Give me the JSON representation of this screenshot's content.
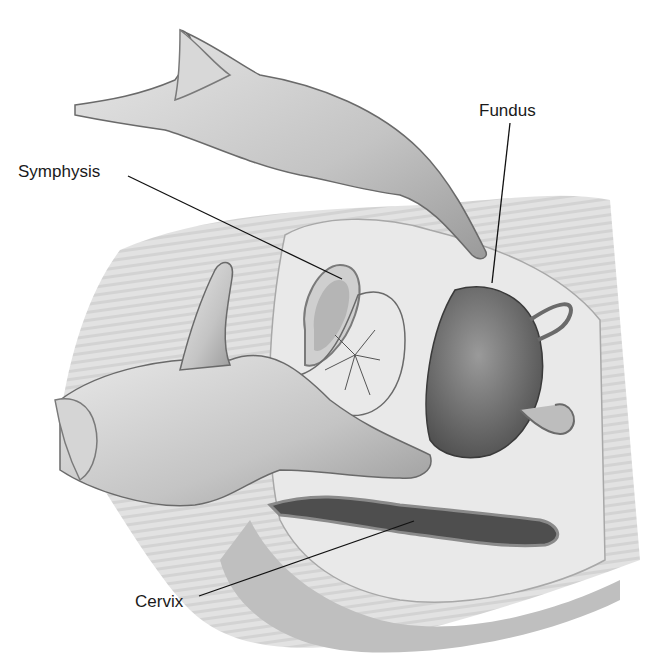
{
  "figure": {
    "type": "anatomical illustration",
    "colors": {
      "background": "#ffffff",
      "skin_light": "#d9d9d9",
      "skin_mid": "#b8b8b8",
      "tissue_dark": "#555555",
      "line": "#1a1a1a"
    }
  },
  "labels": {
    "symphysis": "Symphysis",
    "fundus": "Fundus",
    "cervix": "Cervix"
  }
}
